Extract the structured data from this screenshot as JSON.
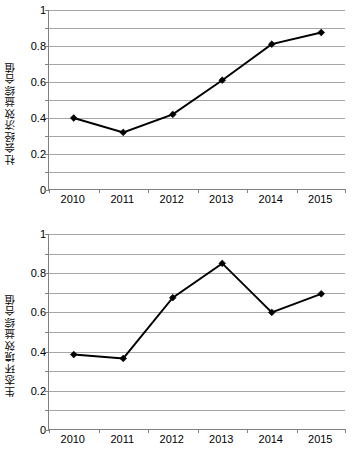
{
  "figure": {
    "panels": [
      {
        "id": "top",
        "axis_title": "社会经济效益综合值",
        "y_ticklabels": [
          "1",
          "0.8",
          "0.6",
          "0.4",
          "0.2",
          "0"
        ],
        "x_ticklabels": [
          "2010",
          "2011",
          "2012",
          "2013",
          "2014",
          "2015"
        ]
      },
      {
        "id": "bottom",
        "axis_title": "生态环境效益综合值",
        "y_ticklabels": [
          "1",
          "0.8",
          "0.6",
          "0.4",
          "0.2",
          "0"
        ],
        "x_ticklabels": [
          "2010",
          "2011",
          "2012",
          "2013",
          "2014",
          "2015"
        ]
      }
    ]
  },
  "colors": {
    "line": "#000000",
    "marker": "#000000",
    "grid": "#a6a6a6",
    "axis": "#808080",
    "background": "#ffffff"
  },
  "chart_data": [
    {
      "type": "line",
      "title": "",
      "xlabel": "",
      "ylabel": "社会经济效益综合值",
      "categories": [
        "2010",
        "2011",
        "2012",
        "2013",
        "2014",
        "2015"
      ],
      "values": [
        0.4,
        0.32,
        0.42,
        0.61,
        0.81,
        0.875
      ],
      "ylim": [
        0,
        1
      ],
      "yticks": [
        0,
        0.2,
        0.4,
        0.6,
        0.8,
        1
      ],
      "minor_gridlines": [
        0.1,
        0.3,
        0.5,
        0.7,
        0.9
      ],
      "grid": true,
      "legend": "none",
      "marker": "diamond"
    },
    {
      "type": "line",
      "title": "",
      "xlabel": "",
      "ylabel": "生态环境效益综合值",
      "categories": [
        "2010",
        "2011",
        "2012",
        "2013",
        "2014",
        "2015"
      ],
      "values": [
        0.385,
        0.365,
        0.675,
        0.85,
        0.6,
        0.695
      ],
      "ylim": [
        0,
        1
      ],
      "yticks": [
        0,
        0.2,
        0.4,
        0.6,
        0.8,
        1
      ],
      "minor_gridlines": [
        0.1,
        0.3,
        0.5,
        0.7,
        0.9
      ],
      "grid": true,
      "legend": "none",
      "marker": "diamond"
    }
  ]
}
